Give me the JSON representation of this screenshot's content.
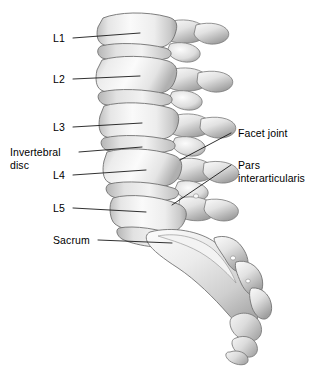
{
  "figure": {
    "background_color": "#ffffff",
    "text_color": "#000000",
    "leader_color": "#1a1a1a",
    "bone_light": "#f4f4f4",
    "bone_mid": "#d8d8d8",
    "bone_shadow": "#9a9a9a",
    "bone_outline": "#6e6e6e"
  },
  "labels": {
    "l1": "L1",
    "l2": "L2",
    "l3": "L3",
    "intervertebral_disc_line1": "Invertebral",
    "intervertebral_disc_line2": "disc",
    "l4": "L4",
    "l5": "L5",
    "sacrum": "Sacrum",
    "facet_joint": "Facet joint",
    "pars_line1": "Pars",
    "pars_line2": "interarticularis"
  }
}
